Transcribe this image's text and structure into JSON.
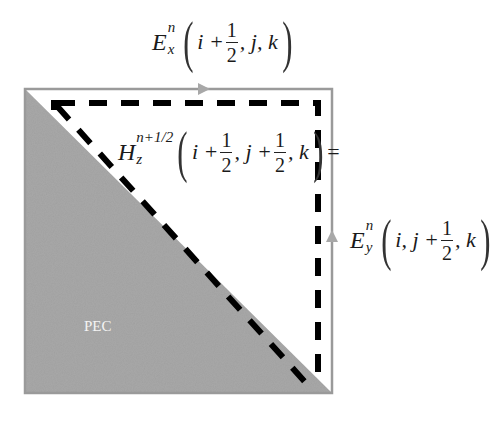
{
  "diagram": {
    "colors": {
      "pec_fill": "#a8a8a8",
      "cell_border": "#9a9a9a",
      "contour": "#000000",
      "arrow": "#a0a0a0",
      "background": "#ffffff",
      "pec_label": "#f4f4f4"
    },
    "labels": {
      "ex": {
        "symbol": "E",
        "superscript": "n",
        "subscript": "x",
        "arg_prefix": "i +",
        "frac_num": "1",
        "frac_den": "2",
        "arg_suffix": ", j, k"
      },
      "hz": {
        "symbol": "H",
        "superscript": "n+1/2",
        "subscript": "z",
        "arg_prefix": "i +",
        "frac1_num": "1",
        "frac1_den": "2",
        "arg_mid": ", j +",
        "frac2_num": "1",
        "frac2_den": "2",
        "arg_suffix": ", k",
        "equals": "="
      },
      "ey": {
        "symbol": "E",
        "superscript": "n",
        "subscript": "y",
        "arg_prefix": "i, j +",
        "frac_num": "1",
        "frac_den": "2",
        "arg_suffix": ", k"
      },
      "pec": "PEC"
    }
  }
}
